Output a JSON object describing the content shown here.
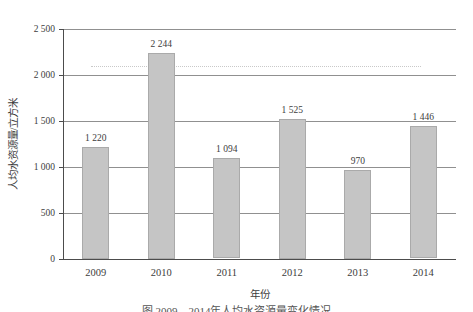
{
  "chart_data": {
    "type": "bar",
    "title": "",
    "categories": [
      "2009",
      "2010",
      "2011",
      "2012",
      "2013",
      "2014"
    ],
    "values": [
      1220,
      2244,
      1094,
      1525,
      970,
      1446
    ],
    "bar_labels": [
      "1 220",
      "2 244",
      "1 094",
      "1 525",
      "970",
      "1 446"
    ],
    "ylabel": "人均水资源量/立方米",
    "xlabel": "年份",
    "ylim": [
      0,
      2500
    ],
    "ytick_interval": 500,
    "ytick_labels": [
      "0",
      "500",
      "1 000",
      "1 500",
      "2 000",
      "2 500"
    ],
    "grid": "horizontal",
    "legend": "none",
    "reference_line": {
      "value": 2100,
      "style": "dotted"
    },
    "colors": {
      "bar_fill": "#c5c5c5",
      "bar_border": "#aaaaaa",
      "gridline": "#909090",
      "axis": "#4c4c4c",
      "text": "#3d3d3d",
      "reference_line": "#c9c9c9",
      "background": "#ffffff"
    }
  },
  "caption": {
    "text": "图 2009—2014年人均水资源量变化情况"
  }
}
